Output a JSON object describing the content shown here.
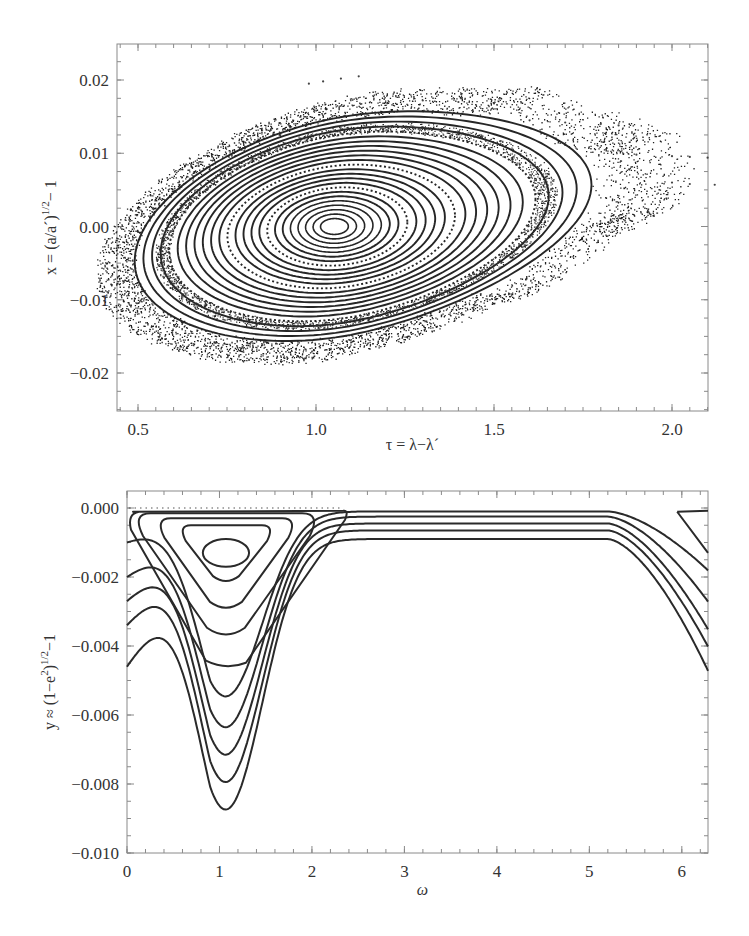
{
  "chart_data": [
    {
      "type": "scatter",
      "title": "",
      "xlabel": "τ = λ−λ´",
      "ylabel": "x = (a/a´)^1/2 − 1",
      "xlim": [
        0.45,
        2.18
      ],
      "ylim": [
        -0.025,
        0.025
      ],
      "xticks": [
        0.5,
        1.0,
        1.5,
        2.0
      ],
      "xtick_labels": [
        "0.5",
        "1.0",
        "1.5",
        "2.0"
      ],
      "yticks": [
        0.02,
        0.01,
        0.0,
        -0.01,
        -0.02
      ],
      "ytick_labels": [
        "0.02",
        "0.01",
        "0.00",
        "−0.01",
        "−0.02"
      ],
      "grid": false,
      "legend": null,
      "description": "Poincaré surface of section: nested closed invariant curves around a fixed point near (1.05, 0.00), surrounded by a chaotic layer extending to τ≈2.15",
      "center": {
        "tau": 1.05,
        "x": 0.0
      },
      "invariant_curves": {
        "count": 24,
        "semi_axis_tau_max": 0.72,
        "semi_axis_x_max": 0.0155
      },
      "chaotic_layer": {
        "tau_range": [
          0.53,
          2.15
        ],
        "x_range": [
          -0.0195,
          0.0175
        ]
      },
      "escaping_trails": [
        {
          "tau": [
            0.98,
            1.02,
            1.07,
            1.12
          ],
          "x": [
            0.0195,
            0.0198,
            0.0202,
            0.0205
          ]
        },
        {
          "tau": [
            1.3,
            1.4,
            1.5
          ],
          "x": [
            0.0172,
            0.017,
            0.0168
          ]
        },
        {
          "tau": [
            1.6,
            1.7,
            1.8,
            1.85
          ],
          "x": [
            0.0145,
            0.0142,
            0.014,
            0.0138
          ]
        },
        {
          "tau": [
            1.9,
            2.0,
            2.05,
            2.1
          ],
          "x": [
            0.0098,
            0.0096,
            0.0095,
            0.0094
          ]
        },
        {
          "tau": [
            2.0,
            2.05,
            2.12
          ],
          "x": [
            0.006,
            0.0058,
            0.0057
          ]
        }
      ]
    },
    {
      "type": "line",
      "title": "",
      "xlabel": "ω",
      "ylabel": "y ≈ (1−e²)^1/2−1",
      "xlim": [
        0,
        6.2832
      ],
      "ylim": [
        -0.01,
        0.0005
      ],
      "xticks": [
        0,
        1,
        2,
        3,
        4,
        5,
        6
      ],
      "xtick_labels": [
        "0",
        "1",
        "2",
        "3",
        "4",
        "5",
        "6"
      ],
      "yticks": [
        0.0,
        -0.002,
        -0.004,
        -0.006,
        -0.008,
        -0.01
      ],
      "ytick_labels": [
        "0.000",
        "−0.002",
        "−0.004",
        "−0.006",
        "−0.008",
        "−0.010"
      ],
      "grid": false,
      "legend": null,
      "description": "Phase portrait in (ω, y): closed librating curves around ω≈1.05, y≈−0.0013; open circulating curves dipping to minima near ω≈1.05",
      "closed_curves": [
        {
          "name": "libration-1",
          "omega_range": [
            0.8,
            1.3
          ],
          "y_range": [
            -0.0017,
            -0.0009
          ]
        },
        {
          "name": "libration-2",
          "omega_range": [
            0.55,
            1.6
          ],
          "y_range": [
            -0.0022,
            -0.0005
          ]
        },
        {
          "name": "libration-3",
          "omega_range": [
            0.3,
            1.85
          ],
          "y_range": [
            -0.003,
            -0.0003
          ]
        },
        {
          "name": "libration-4",
          "omega_range": [
            0.05,
            2.1
          ],
          "y_range": [
            -0.0038,
            -0.00015
          ]
        },
        {
          "name": "separatrix-like",
          "omega_range": [
            0.0,
            2.35
          ],
          "y_range": [
            -0.0046,
            -5e-05
          ]
        }
      ],
      "open_curves": [
        {
          "name": "circulation-1",
          "y_left": -0.001,
          "y_min": -0.0055,
          "y_max": -0.0001,
          "y_right": -0.0018
        },
        {
          "name": "circulation-2",
          "y_left": -0.002,
          "y_min": -0.0064,
          "y_max": -0.00025,
          "y_right": -0.0027
        },
        {
          "name": "circulation-3",
          "y_left": -0.0027,
          "y_min": -0.0072,
          "y_max": -0.00045,
          "y_right": -0.0035
        },
        {
          "name": "circulation-4",
          "y_left": -0.0034,
          "y_min": -0.008,
          "y_max": -0.00065,
          "y_right": -0.004
        },
        {
          "name": "circulation-5",
          "y_left": -0.0046,
          "y_min": -0.0088,
          "y_max": -0.0009,
          "y_right": -0.0047
        }
      ],
      "minimum_omega": 1.07
    }
  ]
}
